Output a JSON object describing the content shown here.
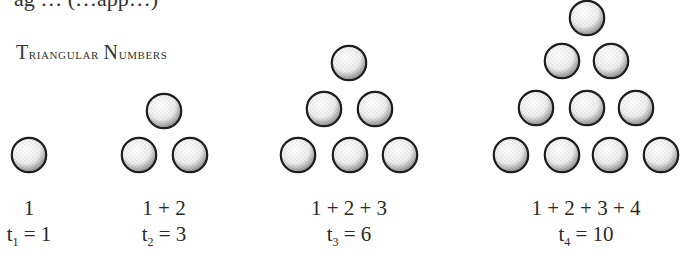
{
  "top_clipped_text": "ag … (…app…)",
  "heading": {
    "first": "T",
    "rest1": "riangular ",
    "first2": "N",
    "rest2": "umbers"
  },
  "colors": {
    "ink": "#2a2a2a",
    "ball_fill": "#f4f4f4",
    "ball_outline": "#1e1e1e"
  },
  "groups": [
    {
      "n": 1,
      "sum": "1",
      "t_var": "t",
      "t_sub": "1",
      "t_eq": "= 1",
      "center_x": 29,
      "balls": [
        [
          29,
          155
        ]
      ]
    },
    {
      "n": 2,
      "sum": "1 + 2",
      "t_var": "t",
      "t_sub": "2",
      "t_eq": "= 3",
      "center_x": 164,
      "balls": [
        [
          164,
          111
        ],
        [
          139,
          155
        ],
        [
          190,
          155
        ]
      ]
    },
    {
      "n": 3,
      "sum": "1 + 2 + 3",
      "t_var": "t",
      "t_sub": "3",
      "t_eq": "= 6",
      "center_x": 349,
      "balls": [
        [
          349,
          63
        ],
        [
          324,
          109
        ],
        [
          375,
          109
        ],
        [
          298,
          155
        ],
        [
          350,
          155
        ],
        [
          400,
          155
        ]
      ]
    },
    {
      "n": 4,
      "sum": "1 + 2 + 3 + 4",
      "t_var": "t",
      "t_sub": "4",
      "t_eq": "= 10",
      "center_x": 586,
      "balls": [
        [
          587,
          18
        ],
        [
          562,
          61
        ],
        [
          611,
          61
        ],
        [
          536,
          108
        ],
        [
          587,
          108
        ],
        [
          636,
          108
        ],
        [
          511,
          155
        ],
        [
          562,
          155
        ],
        [
          610,
          155
        ],
        [
          661,
          155
        ]
      ]
    }
  ],
  "ball_radius": 18
}
